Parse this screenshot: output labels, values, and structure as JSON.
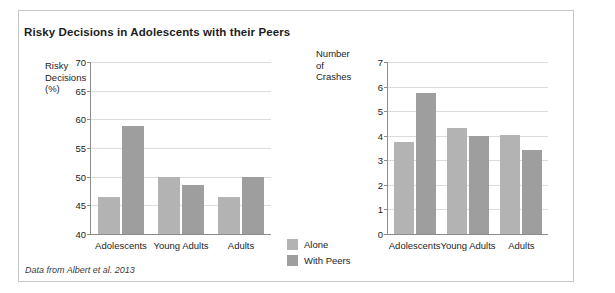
{
  "figure": {
    "title": "Risky Decisions in Adolescents with their Peers",
    "source_note": "Data from Albert et al. 2013",
    "colors": {
      "alone": "#b3b3b3",
      "with_peers": "#9e9e9e",
      "axis": "#8c8c8c",
      "grid": "#dcdcdc",
      "frame": "#c8c8c8"
    }
  },
  "legend": {
    "position": "bottom-center",
    "items": [
      {
        "label": "Alone",
        "color": "#b3b3b3"
      },
      {
        "label": "With Peers",
        "color": "#9e9e9e"
      }
    ]
  },
  "chart_data": [
    {
      "type": "bar",
      "title": "Risky Decisions in Adolescents with their Peers",
      "panel": "left",
      "ylabel": "Risky\nDecisions\n(%)",
      "xlabel": "",
      "categories": [
        "Adolescents",
        "Young Adults",
        "Adults"
      ],
      "series": [
        {
          "name": "Alone",
          "values": [
            46.4,
            50.0,
            46.4
          ]
        },
        {
          "name": "With Peers",
          "values": [
            58.8,
            48.5,
            50.0
          ]
        }
      ],
      "ylim": [
        40,
        70
      ],
      "yticks": [
        40,
        45,
        50,
        55,
        60,
        65,
        70
      ],
      "grid": true
    },
    {
      "type": "bar",
      "panel": "right",
      "ylabel": "Number of\nCrashes",
      "xlabel": "",
      "categories": [
        "Adolescents",
        "Young Adults",
        "Adults"
      ],
      "series": [
        {
          "name": "Alone",
          "values": [
            3.75,
            4.3,
            4.05
          ]
        },
        {
          "name": "With Peers",
          "values": [
            5.75,
            4.0,
            3.4
          ]
        }
      ],
      "ylim": [
        0,
        7
      ],
      "yticks": [
        0,
        1,
        2,
        3,
        4,
        5,
        6,
        7
      ],
      "grid": true
    }
  ]
}
